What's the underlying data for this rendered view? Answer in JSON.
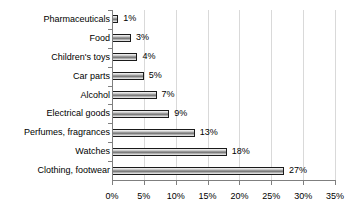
{
  "chart_data": {
    "type": "bar",
    "orientation": "horizontal",
    "title": "",
    "xlabel": "",
    "ylabel": "",
    "xlim": [
      0,
      35
    ],
    "grid": true,
    "legend": false,
    "categories": [
      "Pharmaceuticals",
      "Food",
      "Children's toys",
      "Car parts",
      "Alcohol",
      "Electrical goods",
      "Perfumes, fragrances",
      "Watches",
      "Clothing, footwear"
    ],
    "values": [
      1,
      3,
      4,
      5,
      7,
      9,
      13,
      18,
      27
    ],
    "data_labels": [
      "1%",
      "3%",
      "4%",
      "5%",
      "7%",
      "9%",
      "13%",
      "18%",
      "27%"
    ],
    "xticks": [
      0,
      5,
      10,
      15,
      20,
      25,
      30,
      35
    ],
    "xtick_labels": [
      "0%",
      "5%",
      "10%",
      "15%",
      "20%",
      "25%",
      "30%",
      "35%"
    ],
    "bar_fill_color": "#8c8c8c",
    "bar_border_color": "#1a1a1a",
    "gridline_color": "#d9d9d9",
    "axis_color": "#7f7f7f",
    "background_color": "#ffffff"
  }
}
